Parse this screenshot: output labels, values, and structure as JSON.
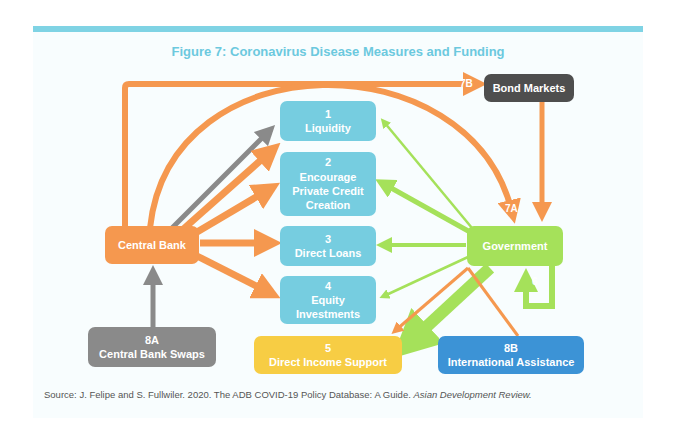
{
  "figure": {
    "title": "Figure 7: Coronavirus Disease Measures and Funding",
    "source_prefix": "Source: J. Felipe and S. Fullwiler. 2020. The ADB COVID-19 Policy Database: A Guide. ",
    "source_journal": "Asian Development Review."
  },
  "nodes": {
    "central_bank": "Central Bank",
    "government": "Government",
    "bond_markets": "Bond Markets",
    "liquidity": {
      "num": "1",
      "label": "Liquidity"
    },
    "private_credit": {
      "num": "2",
      "label1": "Encourage",
      "label2": "Private Credit",
      "label3": "Creation"
    },
    "direct_loans": {
      "num": "3",
      "label": "Direct Loans"
    },
    "equity": {
      "num": "4",
      "label1": "Equity",
      "label2": "Investments"
    },
    "income_support": {
      "num": "5",
      "label": "Direct Income Support"
    },
    "cb_swaps": {
      "num": "8A",
      "label": "Central Bank Swaps"
    },
    "intl_assistance": {
      "num": "8B",
      "label": "International Assistance"
    }
  },
  "edge_labels": {
    "e7a": "7A",
    "e7b": "7B",
    "e6": "6"
  },
  "colors": {
    "accent": "#7fd3e4",
    "orange": "#f5984f",
    "green": "#a5e15a",
    "gray": "#8a8a8a",
    "cyan": "#76cde0"
  }
}
